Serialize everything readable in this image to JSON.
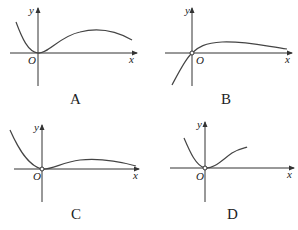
{
  "panels": [
    {
      "id": "A",
      "option_label": "A",
      "y_label": "y",
      "x_label": "x",
      "origin_label": "O",
      "origin_open_circle": false,
      "description": "Decreasing from upper-left to touch origin, then rises to a hump and slowly declines toward x-axis"
    },
    {
      "id": "B",
      "option_label": "B",
      "y_label": "y",
      "x_label": "x",
      "origin_label": "O",
      "origin_open_circle": true,
      "description": "Increasing from lower-left through origin (open circle), rises to hump, then slowly decreases toward x-axis"
    },
    {
      "id": "C",
      "option_label": "C",
      "y_label": "y",
      "x_label": "x",
      "origin_label": "O",
      "origin_open_circle": true,
      "description": "Decreasing from upper-left to origin (open circle), then small hump and slowly decreases toward x-axis"
    },
    {
      "id": "D",
      "option_label": "D",
      "y_label": "y",
      "x_label": "x",
      "origin_label": "O",
      "origin_open_circle": true,
      "description": "Decreasing from upper-left to origin (open circle), then increases steadily upward to the right"
    }
  ]
}
